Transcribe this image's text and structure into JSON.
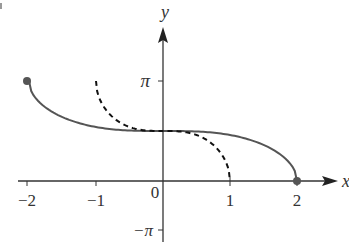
{
  "chart_data": {
    "type": "line",
    "title": "",
    "xlabel": "x",
    "ylabel": "y",
    "xlim": [
      -2.2,
      2.4
    ],
    "ylim": [
      -3.3,
      5.0
    ],
    "grid": false,
    "x_ticks": [
      "-2",
      "-1",
      "1",
      "2"
    ],
    "y_ticks": [
      "π",
      "−π"
    ],
    "origin_label": "0",
    "series": [
      {
        "name": "solid curve",
        "style": "solid",
        "domain": [
          -2,
          2
        ],
        "x": [
          -2,
          -1.5,
          -1,
          -0.5,
          0,
          0.5,
          1,
          1.5,
          2
        ],
        "y": [
          3.1416,
          2.0,
          1.696,
          1.586,
          1.5708,
          1.555,
          1.445,
          1.141,
          0
        ],
        "endpoints": [
          {
            "x": -2,
            "y": 3.1416,
            "filled": true
          },
          {
            "x": 2,
            "y": 0,
            "filled": true
          }
        ]
      },
      {
        "name": "dashed curve",
        "style": "dashed",
        "domain": [
          -1,
          1
        ],
        "x": [
          -1,
          -0.9,
          -0.75,
          -0.5,
          0,
          0.5,
          0.75,
          0.9,
          1
        ],
        "y": [
          3.1416,
          2.38,
          2.0,
          1.696,
          1.5708,
          1.445,
          1.141,
          0.76,
          0
        ]
      }
    ]
  },
  "labels": {
    "x_axis": "x",
    "y_axis": "y",
    "pi": "π",
    "neg_pi": "−π",
    "zero": "0",
    "tick_neg2": "−2",
    "tick_neg1": "−1",
    "tick_1": "1",
    "tick_2": "2"
  }
}
